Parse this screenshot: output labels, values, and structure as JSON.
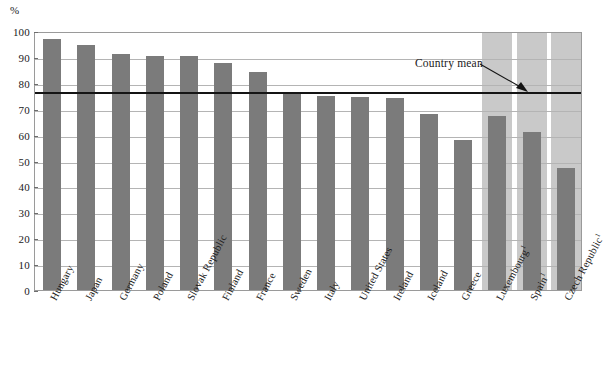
{
  "chart_data": {
    "type": "bar",
    "title": "",
    "subtitle": "",
    "xlabel": "",
    "ylabel": "%",
    "ylim": [
      0,
      100
    ],
    "ytick_step": 10,
    "yticks": [
      "100",
      "90",
      "80",
      "70",
      "60",
      "50",
      "40",
      "30",
      "20",
      "10",
      "0"
    ],
    "grid": true,
    "legend": "none",
    "categories": [
      "Hungary",
      "Japan",
      "Germany",
      "Poland",
      "Slovak Republic",
      "Finland",
      "France",
      "Sweden",
      "Italy",
      "United States",
      "Ireland",
      "Iceland",
      "Greece",
      "Luxembourg",
      "Spain",
      "Czech Republic"
    ],
    "category_footnotes": [
      "",
      "",
      "",
      "",
      "",
      "",
      "",
      "",
      "",
      "",
      "",
      "",
      "",
      "1",
      "1",
      "1"
    ],
    "values": [
      97,
      94.5,
      91,
      90.5,
      90.5,
      87.5,
      84,
      75.5,
      75,
      74.5,
      74,
      68,
      58,
      67,
      61,
      47
    ],
    "highlighted_categories": [
      "Luxembourg",
      "Spain",
      "Czech Republic"
    ],
    "annotations": [
      {
        "name": "country-mean",
        "label": "Country mean",
        "value": 77,
        "type": "horizontal-reference-line"
      }
    ],
    "colors": {
      "bar": "#7b7b7b",
      "highlight_band": "#c9c9c9",
      "mean_line": "#141414",
      "gridline": "#b4b4b4",
      "frame": "#9a9a9a",
      "background": "#ffffff"
    }
  },
  "axis": {
    "y_unit_label": "%"
  },
  "annotation": {
    "country_mean_label": "Country mean"
  }
}
